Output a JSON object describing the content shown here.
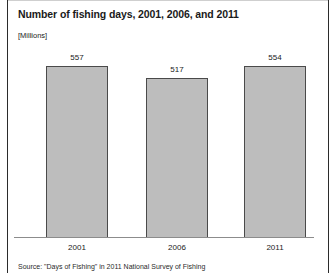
{
  "chart_data": {
    "type": "bar",
    "title": "Number of fishing days, 2001, 2006, and 2011",
    "subtitle": "[Millions]",
    "categories": [
      "2001",
      "2006",
      "2011"
    ],
    "values": [
      557,
      517,
      554
    ],
    "value_labels": [
      "557",
      "517",
      "554"
    ],
    "xlabel": "",
    "ylabel": "Millions",
    "ylim": [
      0,
      620
    ],
    "grid": false,
    "legend": false,
    "bar_fill_color": "#bdbdbd",
    "bar_border_color": "#4a4a4a",
    "axis_color": "#8c8c8c",
    "text_color": "#1a1a1a"
  },
  "source": {
    "note": "Source: \"Days of Fishing\" in 2011 National Survey of Fishing"
  }
}
